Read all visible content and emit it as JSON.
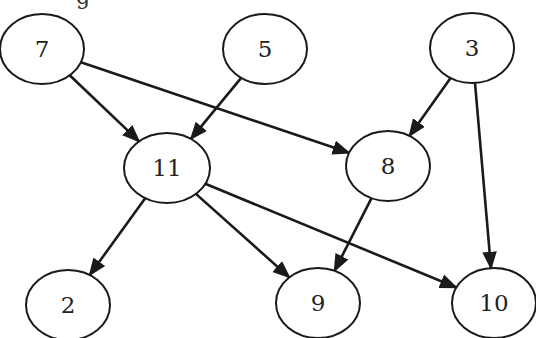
{
  "diagram": {
    "type": "directed-acyclic-graph",
    "top_cutoff_text": "g",
    "colors": {
      "stroke": "#1a1a1a",
      "text": "#222222",
      "background": "#ffffff"
    },
    "nodes": [
      {
        "id": "7",
        "label": "7",
        "cx": 42,
        "cy": 49,
        "rx": 42,
        "ry": 35
      },
      {
        "id": "5",
        "label": "5",
        "cx": 265,
        "cy": 49,
        "rx": 42,
        "ry": 35
      },
      {
        "id": "3",
        "label": "3",
        "cx": 472,
        "cy": 48,
        "rx": 42,
        "ry": 35
      },
      {
        "id": "11",
        "label": "11",
        "cx": 167,
        "cy": 168,
        "rx": 43,
        "ry": 35
      },
      {
        "id": "8",
        "label": "8",
        "cx": 388,
        "cy": 166,
        "rx": 42,
        "ry": 35
      },
      {
        "id": "2",
        "label": "2",
        "cx": 68,
        "cy": 305,
        "rx": 42,
        "ry": 35
      },
      {
        "id": "9",
        "label": "9",
        "cx": 318,
        "cy": 303,
        "rx": 42,
        "ry": 35
      },
      {
        "id": "10",
        "label": "10",
        "cx": 494,
        "cy": 303,
        "rx": 42,
        "ry": 35
      }
    ],
    "edges": [
      {
        "from": "7",
        "to": "11"
      },
      {
        "from": "7",
        "to": "8"
      },
      {
        "from": "5",
        "to": "11"
      },
      {
        "from": "3",
        "to": "8"
      },
      {
        "from": "3",
        "to": "10"
      },
      {
        "from": "11",
        "to": "2"
      },
      {
        "from": "11",
        "to": "9"
      },
      {
        "from": "11",
        "to": "10"
      },
      {
        "from": "8",
        "to": "9"
      }
    ]
  }
}
